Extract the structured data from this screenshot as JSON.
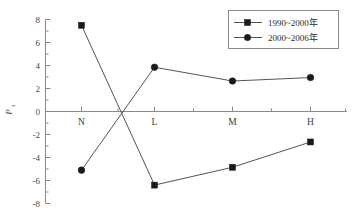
{
  "chart_data": {
    "type": "line",
    "title": "",
    "xlabel": "",
    "ylabel": "P",
    "ylabel_sub": "s",
    "categories": [
      "N",
      "L",
      "M",
      "H"
    ],
    "series": [
      {
        "name": "1990~2000年",
        "marker": "square",
        "values": [
          7.5,
          -6.4,
          -4.85,
          -2.65
        ]
      },
      {
        "name": "2000~2006年",
        "marker": "circle",
        "values": [
          -5.1,
          3.85,
          2.65,
          2.95
        ]
      }
    ],
    "ylim": [
      -8,
      8
    ],
    "ytick_labels": [
      "8",
      "6",
      "4",
      "2",
      "0",
      "-2",
      "-4",
      "-6",
      "-8"
    ],
    "ytick_values": [
      8,
      6,
      4,
      2,
      0,
      -2,
      -4,
      -6,
      -8
    ],
    "grid": false,
    "legend_position": "top-right"
  },
  "colors": {
    "axis": "#8a8a8a",
    "line": "#555555",
    "marker": "#1a1a1a",
    "text": "#3a3a3a",
    "background": "#ffffff"
  }
}
